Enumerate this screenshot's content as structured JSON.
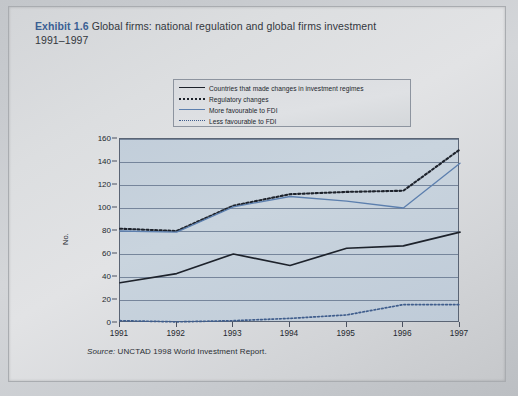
{
  "header": {
    "exhibit_label": "Exhibit 1.6",
    "title": "Global firms: national regulation and global firms investment",
    "subtitle": "1991–1997",
    "accent_color": "#3a5f93"
  },
  "source": {
    "prefix": "Source:",
    "text": "UNCTAD 1998 World Investment Report."
  },
  "chart_data": {
    "type": "line",
    "title": "Global firms: national regulation and global firms investment 1991–1997",
    "xlabel": "",
    "ylabel": "No.",
    "x": [
      "1991",
      "1992",
      "1993",
      "1994",
      "1995",
      "1996",
      "1997"
    ],
    "categories": [
      "1991",
      "1992",
      "1993",
      "1994",
      "1995",
      "1996",
      "1997"
    ],
    "ylim": [
      0,
      160
    ],
    "ytick_values": [
      0,
      20,
      40,
      60,
      80,
      100,
      120,
      140,
      160
    ],
    "ytick_labels": [
      "0",
      "20",
      "40",
      "60",
      "80",
      "100",
      "120",
      "140",
      "160"
    ],
    "grid": true,
    "legend_position": "top-center",
    "series": [
      {
        "name": "Countries that made changes in investment regimes",
        "style": "solid",
        "color": "#1d222b",
        "values": [
          35,
          43,
          60,
          50,
          65,
          67,
          79
        ]
      },
      {
        "name": "Regulatory changes",
        "style": "dotted",
        "color": "#1d222b",
        "values": [
          82,
          80,
          102,
          112,
          114,
          115,
          151
        ]
      },
      {
        "name": "More favourable to FDI",
        "style": "solid",
        "color": "#5c7fae",
        "values": [
          80,
          79,
          101,
          110,
          106,
          100,
          139
        ]
      },
      {
        "name": "Less favourable to FDI",
        "style": "dotted",
        "color": "#3f5d8c",
        "values": [
          2,
          1,
          2,
          4,
          7,
          16,
          16
        ]
      }
    ]
  }
}
